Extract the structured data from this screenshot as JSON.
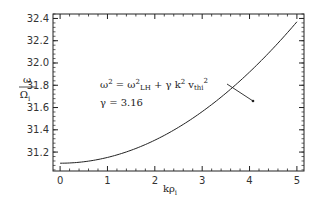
{
  "chart_data": {
    "type": "line",
    "title": "",
    "xlabel": "kρi",
    "ylabel": "ω/Ωi",
    "xlim": [
      -0.15,
      5.15
    ],
    "ylim": [
      31.03,
      32.44
    ],
    "xticks": [
      "0",
      "1",
      "2",
      "3",
      "4",
      "5"
    ],
    "yticks": [
      "31.2",
      "31.4",
      "31.6",
      "31.8",
      "32.0",
      "32.2",
      "32.4"
    ],
    "grid": false,
    "legend": null,
    "series": [
      {
        "name": "ω² = ω²_LH + γ k² v_thi²",
        "x": [
          0,
          0.5,
          1.0,
          1.5,
          2.0,
          2.5,
          3.0,
          3.5,
          4.0,
          4.5,
          5.0
        ],
        "y": [
          31.1,
          31.11,
          31.15,
          31.22,
          31.3,
          31.41,
          31.54,
          31.69,
          31.86,
          32.05,
          32.37
        ]
      }
    ],
    "annotations": [
      {
        "text": "ω² = ω²LH + γ k² vthi²",
        "arrow_to_x": 3.4,
        "arrow_to_y": 31.69
      },
      {
        "text": "γ = 3.16"
      }
    ]
  },
  "labels": {
    "ylabel_num": "ω",
    "ylabel_den": "Ω",
    "ylabel_den_sub": "i",
    "xlabel_main": "kρ",
    "xlabel_sub": "i",
    "eq_omega": "ω",
    "eq_sup2": "2",
    "eq_eq": " = ω",
    "eq_lh": "LH",
    "eq_plus": " + γ  k",
    "eq_v": " v",
    "eq_thi": "thi",
    "gamma": "γ = 3.16"
  }
}
